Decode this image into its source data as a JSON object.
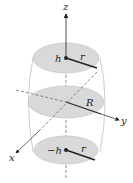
{
  "diagram": {
    "axes": {
      "x_label": "x",
      "y_label": "y",
      "z_label": "z"
    },
    "sections": [
      {
        "name": "top",
        "height_label": "h",
        "radius_label": "r"
      },
      {
        "name": "middle",
        "radius_label": "R"
      },
      {
        "name": "bottom",
        "height_label": "−h",
        "radius_label": "r"
      }
    ],
    "colors": {
      "disk_fill": "#d9d9d9",
      "disk_stroke": "#bdbdbd",
      "line": "#222222",
      "outline": "#aaaaaa"
    }
  }
}
